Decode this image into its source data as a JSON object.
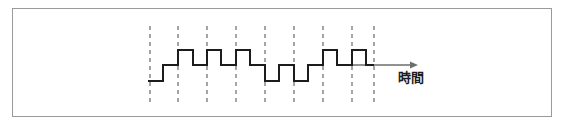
{
  "figure": {
    "kind": "waveform-timing-diagram",
    "frame": {
      "x": 12,
      "y": 8,
      "width": 540,
      "height": 109,
      "border_color": "#9a9a9a",
      "background": "#ffffff"
    },
    "axis": {
      "label": "時間",
      "label_x": 398,
      "label_y": 82,
      "arrow_start_x": 352,
      "arrow_end_x": 418,
      "arrow_y": 65,
      "color": "#6e6e6e"
    },
    "gridlines": {
      "style": "dashed",
      "color": "#6b6b6b",
      "dash": "4,4",
      "top_y": 26,
      "bottom_y": 105,
      "x_positions": [
        150,
        178,
        207,
        236,
        265,
        294,
        323,
        352,
        374
      ]
    },
    "signal": {
      "color": "#1c1c1c",
      "stroke_width": 2,
      "levels": {
        "high": 50,
        "zero": 65,
        "low": 81
      },
      "level_names": [
        "high",
        "zero",
        "low"
      ],
      "start_x": 148,
      "end_x": 374,
      "points": [
        [
          148,
          81
        ],
        [
          163,
          81
        ],
        [
          163,
          65
        ],
        [
          178,
          65
        ],
        [
          178,
          50
        ],
        [
          193,
          50
        ],
        [
          193,
          65
        ],
        [
          207,
          65
        ],
        [
          207,
          50
        ],
        [
          221,
          50
        ],
        [
          221,
          65
        ],
        [
          236,
          65
        ],
        [
          236,
          50
        ],
        [
          250,
          50
        ],
        [
          250,
          65
        ],
        [
          265,
          65
        ],
        [
          265,
          81
        ],
        [
          279,
          81
        ],
        [
          279,
          65
        ],
        [
          294,
          65
        ],
        [
          294,
          81
        ],
        [
          308,
          81
        ],
        [
          308,
          65
        ],
        [
          323,
          65
        ],
        [
          323,
          50
        ],
        [
          337,
          50
        ],
        [
          337,
          65
        ],
        [
          352,
          65
        ],
        [
          352,
          50
        ],
        [
          366,
          50
        ],
        [
          366,
          65
        ],
        [
          374,
          65
        ]
      ]
    }
  },
  "chart_data": {
    "type": "line",
    "title": "",
    "xlabel": "時間",
    "ylabel": "",
    "grid": true,
    "legend": "none",
    "xlim": [
      148,
      374
    ],
    "ylim": [
      "low",
      "high"
    ],
    "tick_positions": [
      150,
      178,
      207,
      236,
      265,
      294,
      323,
      352,
      374
    ],
    "level_values": {
      "high": 1,
      "zero": 0,
      "low": -1
    },
    "symbols": [
      -1,
      1,
      1,
      1,
      -1,
      -1,
      1,
      1
    ],
    "annotations": [
      "時間"
    ]
  }
}
